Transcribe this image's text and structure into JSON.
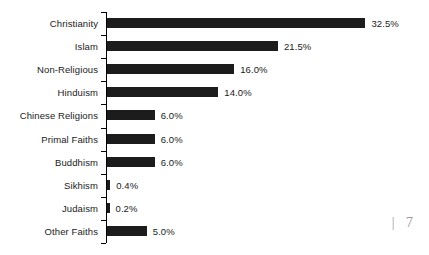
{
  "chart_data": {
    "type": "bar",
    "orientation": "horizontal",
    "title": "",
    "subtitle": "",
    "xlabel": "",
    "ylabel": "",
    "grid": false,
    "legend": null,
    "xlim": [
      0,
      35
    ],
    "value_suffix": "%",
    "categories": [
      "Christianity",
      "Islam",
      "Non-Religious",
      "Hinduism",
      "Chinese Religions",
      "Primal Faiths",
      "Buddhism",
      "Sikhism",
      "Judaism",
      "Other Faiths"
    ],
    "values": [
      32.5,
      21.5,
      16.0,
      14.0,
      6.0,
      6.0,
      6.0,
      0.4,
      0.2,
      5.0
    ],
    "data_labels": [
      "32.5%",
      "21.5%",
      "16.0%",
      "14.0%",
      "6.0%",
      "6.0%",
      "6.0%",
      "0.4%",
      "0.2%",
      "5.0%"
    ],
    "bar_color": "#1c1c1c",
    "axis_color": "#000000",
    "text_color": "#1a1a1a",
    "background_color": "#ffffff"
  },
  "page_marker": {
    "text": "| 7",
    "color": "#9a9a9a"
  }
}
